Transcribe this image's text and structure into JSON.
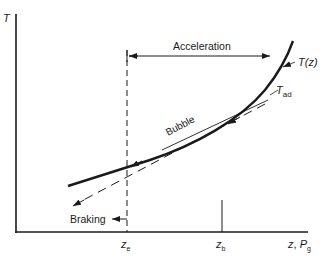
{
  "diagram": {
    "axes": {
      "y_label": "T",
      "x_label_main": "z",
      "x_label_sep": ", ",
      "x_label_second": "P",
      "x_label_second_sub": "g"
    },
    "ticks": {
      "ze_main": "z",
      "ze_sub": "e",
      "zb_main": "z",
      "zb_sub": "b"
    },
    "labels": {
      "acceleration": "Acceleration",
      "braking": "Braking",
      "bubble": "Bubble",
      "curve_main": "T(z)",
      "tad_main": "T",
      "tad_sub": "ad"
    },
    "colors": {
      "ink": "#1a1a1a",
      "background": "#ffffff"
    }
  }
}
